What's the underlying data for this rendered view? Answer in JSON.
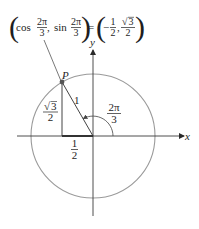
{
  "equation": {
    "open_left": "(",
    "cos_word": "cos",
    "cos_num": "2π",
    "cos_den": "3",
    "comma_1": ",",
    "sin_word": "sin",
    "sin_num": "2π",
    "sin_den": "3",
    "close_left": ")",
    "equals": "=",
    "open_right": "(",
    "x_sign": "−",
    "x_num": "1",
    "x_den": "2",
    "comma_2": ",",
    "y_num_radical": "√",
    "y_num_radicand": "3",
    "y_den": "2",
    "close_right": ")"
  },
  "axes": {
    "x_label": "x",
    "y_label": "y"
  },
  "point": {
    "label": "P",
    "angle": "2π/3"
  },
  "labels": {
    "radius": "1",
    "height_radical": "√",
    "height_radicand": "3",
    "height_den": "2",
    "angle_num": "2π",
    "angle_den": "3",
    "base_num": "1",
    "base_den": "2"
  },
  "colors": {
    "circle": "#9a9a9a",
    "axes": "#3a3a3a",
    "lines": "#444444",
    "text": "#1e1e1e"
  }
}
